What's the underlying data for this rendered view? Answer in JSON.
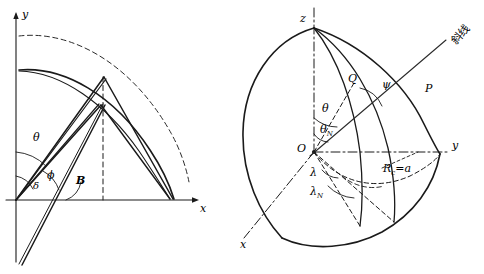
{
  "figure": {
    "type": "geometric-diagram",
    "panels": [
      {
        "id": "left-panel",
        "name": "planar-angle-diagram",
        "axes": {
          "x_label": "x",
          "y_label": "y"
        },
        "angle_labels": [
          {
            "name": "theta",
            "text": "θ"
          },
          {
            "name": "phi",
            "text": "ϕ"
          },
          {
            "name": "delta",
            "text": "δ"
          },
          {
            "name": "B",
            "text": "B"
          }
        ]
      },
      {
        "id": "right-panel",
        "name": "spherical-coordinate-diagram",
        "axes": {
          "x_label": "x",
          "y_label": "y",
          "z_label": "z"
        },
        "point_labels": [
          {
            "name": "origin",
            "text": "O"
          },
          {
            "name": "point-Q",
            "text": "Q"
          },
          {
            "name": "point-P",
            "text": "P"
          }
        ],
        "angle_labels": [
          {
            "name": "theta",
            "text": "θ"
          },
          {
            "name": "theta-subscript-N",
            "text": "θ",
            "sub": "N"
          },
          {
            "name": "psi",
            "text": "ψ"
          },
          {
            "name": "lambda",
            "text": "λ"
          },
          {
            "name": "lambda-subscript-N",
            "text": "λ",
            "sub": "N"
          }
        ],
        "radius_label": {
          "name": "radius",
          "text": "R",
          "sub": "c",
          "eq": "=a"
        },
        "annotation": {
          "name": "oblique-line-annotation",
          "text": "斜线"
        }
      }
    ],
    "colors": {
      "stroke": "#1a1a1a",
      "dash": "#333333",
      "background": "#ffffff"
    }
  }
}
